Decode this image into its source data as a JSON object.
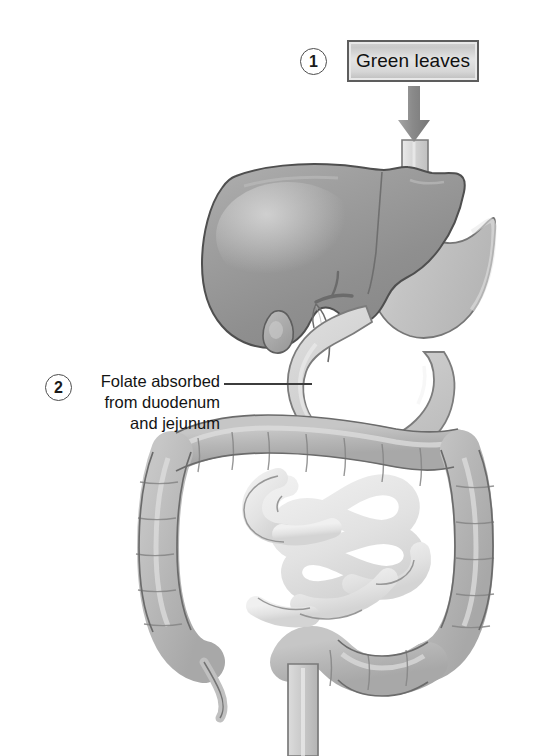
{
  "figure": {
    "background_color": "#ffffff",
    "width": 539,
    "height": 756
  },
  "callouts": [
    {
      "number": "1",
      "type": "source-box",
      "label": "Green leaves",
      "description": "Dietary source of folate entering via the esophagus",
      "box_fill": "#d9d9d9",
      "box_border": "#5d5d5d",
      "arrow_color": "#8c8c8c",
      "arrow_direction": "down"
    },
    {
      "number": "2",
      "type": "leader-line-label",
      "lines": [
        "Folate absorbed",
        "from duodenum",
        "and jejunum"
      ],
      "full_text": "Folate absorbed from duodenum and jejunum",
      "leader_color": "#3c3c3c",
      "points_to": "duodenum"
    }
  ],
  "anatomy": {
    "organs": [
      {
        "name": "esophagus",
        "fill": "#d8d8d8",
        "stroke": "#777777"
      },
      {
        "name": "liver",
        "fill": "#9a9a9a",
        "stroke": "#4a4a4a"
      },
      {
        "name": "gallbladder",
        "fill": "#a8a8a8",
        "stroke": "#5a5a5a"
      },
      {
        "name": "bile-duct",
        "fill": "#a2a2a2",
        "stroke": "#606060"
      },
      {
        "name": "stomach",
        "fill": "#c6c6c6",
        "stroke": "#7a7a7a"
      },
      {
        "name": "duodenum",
        "fill": "#cfcfcf",
        "stroke": "#808080"
      },
      {
        "name": "jejunum-ileum",
        "fill": "#e3e3e3",
        "stroke": "#8a8a8a"
      },
      {
        "name": "ascending-colon",
        "fill": "#b8b8b8",
        "stroke": "#6e6e6e"
      },
      {
        "name": "transverse-colon",
        "fill": "#b8b8b8",
        "stroke": "#6e6e6e"
      },
      {
        "name": "descending-colon",
        "fill": "#b8b8b8",
        "stroke": "#6e6e6e"
      },
      {
        "name": "sigmoid-colon",
        "fill": "#b8b8b8",
        "stroke": "#6e6e6e"
      },
      {
        "name": "rectum",
        "fill": "#cccccc",
        "stroke": "#7a7a7a"
      },
      {
        "name": "appendix",
        "fill": "#bdbdbd",
        "stroke": "#707070"
      }
    ],
    "palette": {
      "liver_dark": "#8e8e8e",
      "liver_light": "#b4b4b4",
      "colon_mid": "#b8b8b8",
      "colon_highlight": "#dedede",
      "small_intestine": "#e8e8e8",
      "outline": "#6a6a6a"
    }
  }
}
